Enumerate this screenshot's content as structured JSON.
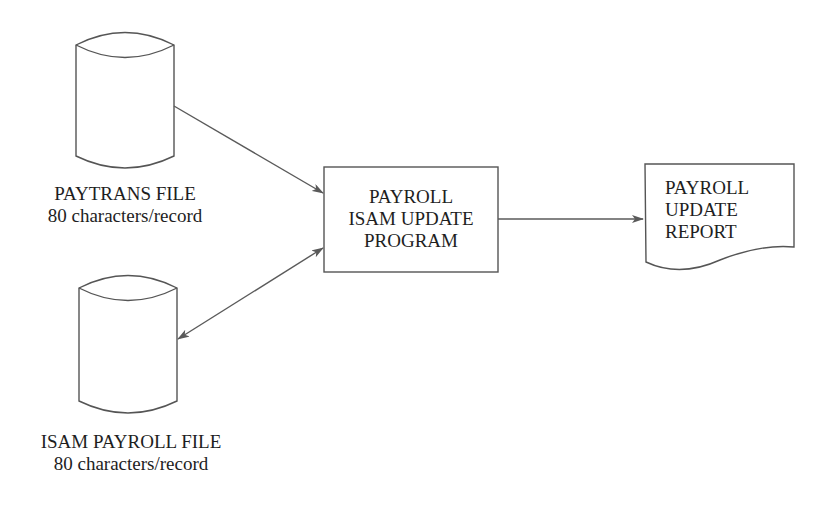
{
  "diagram": {
    "type": "system-flowchart",
    "nodes": {
      "paytrans_file": {
        "shape": "disk-cylinder",
        "title": "PAYTRANS FILE",
        "subtitle": "80 characters/record"
      },
      "isam_payroll_file": {
        "shape": "disk-cylinder",
        "title": "ISAM PAYROLL FILE",
        "subtitle": "80 characters/record"
      },
      "program": {
        "shape": "process-box",
        "lines": [
          "PAYROLL",
          "ISAM UPDATE",
          "PROGRAM"
        ]
      },
      "report": {
        "shape": "document",
        "lines": [
          "PAYROLL",
          "UPDATE",
          "REPORT"
        ]
      }
    },
    "edges": [
      {
        "from": "paytrans_file",
        "to": "program",
        "direction": "one-way"
      },
      {
        "from": "isam_payroll_file",
        "to": "program",
        "direction": "two-way"
      },
      {
        "from": "program",
        "to": "report",
        "direction": "one-way"
      }
    ],
    "colors": {
      "line": "#555555",
      "text": "#1e1e1e",
      "background": "#ffffff"
    }
  }
}
